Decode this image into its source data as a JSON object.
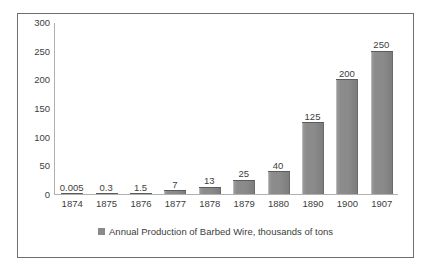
{
  "chart_data": {
    "type": "bar",
    "title": "",
    "xlabel": "",
    "ylabel": "",
    "categories": [
      "1874",
      "1875",
      "1876",
      "1877",
      "1878",
      "1879",
      "1880",
      "1890",
      "1900",
      "1907"
    ],
    "values": [
      0.005,
      0.3,
      1.5,
      7,
      13,
      25,
      40,
      125,
      200,
      250
    ],
    "data_labels": [
      "0.005",
      "0.3",
      "1.5",
      "7",
      "13",
      "25",
      "40",
      "125",
      "200",
      "250"
    ],
    "series": [
      {
        "name": "Annual Production of Barbed Wire, thousands of tons",
        "values": [
          0.005,
          0.3,
          1.5,
          7,
          13,
          25,
          40,
          125,
          200,
          250
        ],
        "color": "#8a8a8a"
      }
    ],
    "ylim": [
      0,
      300
    ],
    "yticks": [
      0,
      50,
      100,
      150,
      200,
      250,
      300
    ],
    "ytick_labels": [
      "0",
      "50",
      "100",
      "150",
      "200",
      "250",
      "300"
    ],
    "grid": false,
    "legend_position": "bottom",
    "legend": [
      "Annual Production of Barbed Wire, thousands of tons"
    ],
    "colors": {
      "bar": "#8a8a8a",
      "bar_edge": "#5b5b5b",
      "axis": "#b0b0b0",
      "frame": "#6f6f6f",
      "text": "#3d3d3d",
      "background": "#ffffff"
    }
  }
}
